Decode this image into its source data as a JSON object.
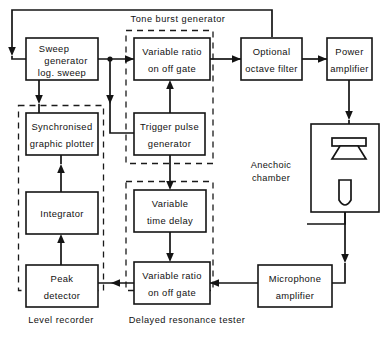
{
  "diagram": {
    "canvas": {
      "width": 382,
      "height": 342,
      "background": "#ffffff"
    },
    "stroke_color": "#141414",
    "blocks": [
      {
        "id": "sweep_generator",
        "lines": [
          "Sweep",
          "generator",
          "log. sweep"
        ]
      },
      {
        "id": "variable_ratio_gate_top",
        "lines": [
          "Variable  ratio",
          "on  off  gate"
        ]
      },
      {
        "id": "optional_octave_filter",
        "lines": [
          "Optional",
          "octave filter"
        ]
      },
      {
        "id": "power_amplifier",
        "lines": [
          "Power",
          "amplifier"
        ]
      },
      {
        "id": "synchronised_graphic_plotter",
        "lines": [
          "Synchronised",
          "graphic plotter"
        ]
      },
      {
        "id": "trigger_pulse_generator",
        "lines": [
          "Trigger   pulse",
          "generator"
        ]
      },
      {
        "id": "integrator",
        "lines": [
          "Integrator"
        ]
      },
      {
        "id": "variable_time_delay",
        "lines": [
          "Variable",
          "time  delay"
        ]
      },
      {
        "id": "peak_detector",
        "lines": [
          "Peak",
          "detector"
        ]
      },
      {
        "id": "variable_ratio_gate_bottom",
        "lines": [
          "Variable  ratio",
          "on  off  gate"
        ]
      },
      {
        "id": "microphone_amplifier",
        "lines": [
          "Microphone",
          "amplifier"
        ]
      }
    ],
    "group_labels": [
      {
        "id": "tone_burst_generator",
        "text": "Tone  burst  generator"
      },
      {
        "id": "level_recorder",
        "text": "Level  recorder"
      },
      {
        "id": "delayed_resonance_tester",
        "text": "Delayed resonance  tester"
      }
    ],
    "area_labels": [
      {
        "id": "anechoic_chamber",
        "lines": [
          "Anechoic",
          "chamber"
        ]
      }
    ],
    "symbols": [
      {
        "id": "loudspeaker",
        "name": "loudspeaker-symbol"
      },
      {
        "id": "microphone",
        "name": "microphone-symbol"
      }
    ]
  }
}
